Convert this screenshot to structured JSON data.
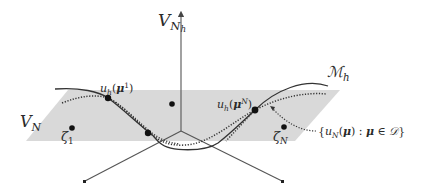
{
  "figure": {
    "labels": {
      "vnh": {
        "base": "V",
        "sub": "N",
        "subsub": "h"
      },
      "vn": {
        "base": "V",
        "sub": "N"
      },
      "manifold": {
        "base": "ℳ",
        "sub": "h"
      },
      "uh_mu1": {
        "func": "u",
        "func_sub": "h",
        "open": "(",
        "arg": "μ",
        "arg_sup": "1",
        "close": ")"
      },
      "uh_muN": {
        "func": "u",
        "func_sub": "h",
        "open": "(",
        "arg": "μ",
        "arg_sup": "N",
        "close": ")"
      },
      "zeta1": {
        "base": "ζ",
        "sub": "1"
      },
      "zetaN": {
        "base": "ζ",
        "sub": "N"
      },
      "reduced_set": {
        "lbrace": "{",
        "func": "u",
        "func_sub": "N",
        "open": "(",
        "arg": "μ",
        "close": ")",
        "colon": " : ",
        "var": "μ",
        "in": " ∈ ",
        "domain": "𝒟",
        "rbrace": "}"
      }
    },
    "colors": {
      "plane_fill": "#d9d9d9",
      "axis_stroke": "#555555",
      "curve_stroke": "#333333",
      "dot_fill": "#111111"
    }
  }
}
